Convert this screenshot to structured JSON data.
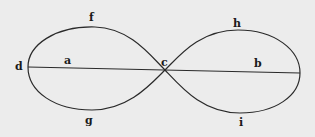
{
  "diagram": {
    "type": "figure-eight curve with horizontal axis",
    "colors": {
      "background": "#ececec",
      "ink": "#2a2a2a"
    },
    "labels": {
      "d": "d",
      "a": "a",
      "f": "f",
      "g": "g",
      "c": "c",
      "h": "h",
      "b": "b",
      "i": "i"
    }
  }
}
